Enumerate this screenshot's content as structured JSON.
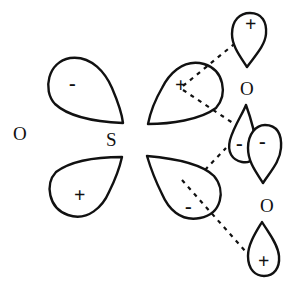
{
  "diagram": {
    "type": "orbital-overlap",
    "colors": {
      "stroke": "#111111",
      "background": "#ffffff"
    },
    "atoms": [
      {
        "id": "O-left",
        "label": "O"
      },
      {
        "id": "S-center",
        "label": "S"
      },
      {
        "id": "O-right-top",
        "label": "O"
      },
      {
        "id": "O-right-bottom",
        "label": "O"
      }
    ],
    "lobes": {
      "s_upper_left": {
        "sign": "-"
      },
      "s_lower_left": {
        "sign": "+"
      },
      "s_upper_right": {
        "sign": "+"
      },
      "s_lower_right": {
        "sign": "-"
      },
      "o1_top": {
        "sign": "+"
      },
      "o1_bottom": {
        "sign": "-"
      },
      "o2_top": {
        "sign": "-"
      },
      "o2_bottom": {
        "sign": "+"
      }
    }
  }
}
